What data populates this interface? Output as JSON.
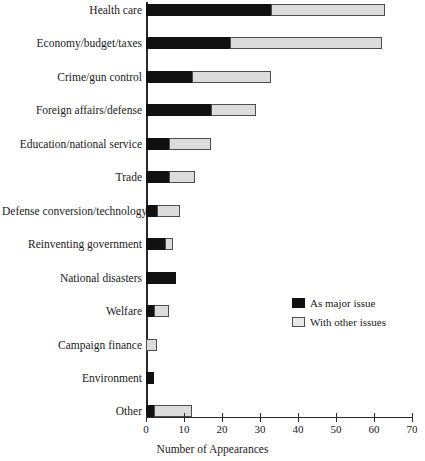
{
  "chart_data": {
    "type": "bar",
    "orientation": "horizontal",
    "stacked": true,
    "title": "",
    "xlabel": "Number of Appearances",
    "ylabel": "",
    "xlim": [
      0,
      70
    ],
    "xticks": [
      0,
      10,
      20,
      30,
      40,
      50,
      60,
      70
    ],
    "grid": false,
    "legend_position": "center-right",
    "categories": [
      "Health care",
      "Economy/budget/taxes",
      "Crime/gun control",
      "Foreign affairs/defense",
      "Education/national service",
      "Trade",
      "Defense conversion/technology",
      "Reinventing government",
      "National disasters",
      "Welfare",
      "Campaign finance",
      "Environment",
      "Other"
    ],
    "series": [
      {
        "name": "As major issue",
        "color": "#111111",
        "values": [
          33,
          22,
          12,
          17,
          6,
          6,
          3,
          5,
          8,
          2,
          0,
          2,
          2
        ]
      },
      {
        "name": "With other issues",
        "color": "#dcdcdc",
        "values": [
          30,
          40,
          21,
          12,
          11,
          7,
          6,
          2,
          0,
          4,
          3,
          0,
          10
        ]
      }
    ],
    "totals": [
      63,
      62,
      33,
      29,
      17,
      13,
      9,
      7,
      8,
      6,
      3,
      2,
      12
    ]
  },
  "legend": {
    "items": [
      {
        "label": "As major issue"
      },
      {
        "label": "With other issues"
      }
    ]
  },
  "axis": {
    "x_title": "Number of Appearances",
    "tick_labels": [
      "0",
      "10",
      "20",
      "30",
      "40",
      "50",
      "60",
      "70"
    ]
  }
}
